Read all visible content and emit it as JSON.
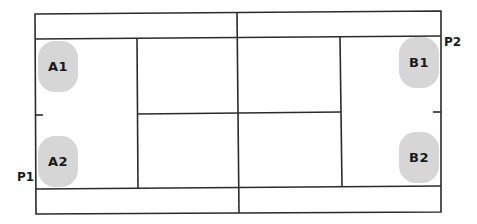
{
  "diagram": {
    "type": "badminton-doubles-court",
    "line_color": "#2b2b2b",
    "player_fill": "#d6d6d6",
    "players": [
      {
        "id": "A1",
        "label": "A1",
        "team": "A",
        "position": "left-top"
      },
      {
        "id": "A2",
        "label": "A2",
        "team": "A",
        "position": "left-bottom"
      },
      {
        "id": "B1",
        "label": "B1",
        "team": "B",
        "position": "right-top"
      },
      {
        "id": "B2",
        "label": "B2",
        "team": "B",
        "position": "right-bottom"
      }
    ],
    "side_labels": {
      "p1": "P1",
      "p2": "P2"
    }
  }
}
